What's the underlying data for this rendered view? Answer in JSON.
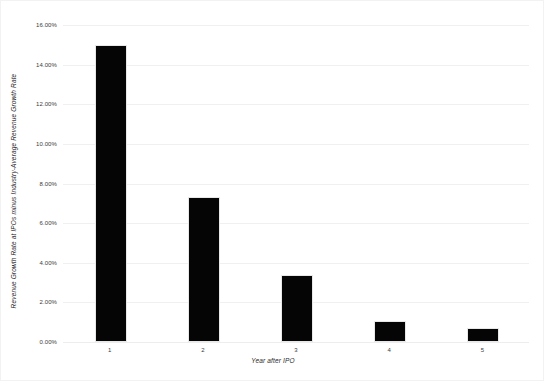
{
  "chart_data": {
    "type": "bar",
    "title": "",
    "xlabel": "Year after IPO",
    "ylabel": "Revenue Growth Rate at IPOs minus Industry-Average Revenue Growth Rate",
    "categories": [
      "1",
      "2",
      "3",
      "4",
      "5"
    ],
    "values": [
      14.9,
      7.2,
      3.3,
      0.95,
      0.6
    ],
    "ylim": [
      0,
      16
    ],
    "ytick_values": [
      0,
      2,
      4,
      6,
      8,
      10,
      12,
      14,
      16
    ],
    "ytick_labels": [
      "0.00%",
      "2.00%",
      "4.00%",
      "6.00%",
      "8.00%",
      "10.00%",
      "12.00%",
      "14.00%",
      "16.00%"
    ],
    "grid": true,
    "legend": null,
    "bar_color": "#050505",
    "grid_color": "#f0f0f0",
    "background_color": "#ffffff"
  }
}
